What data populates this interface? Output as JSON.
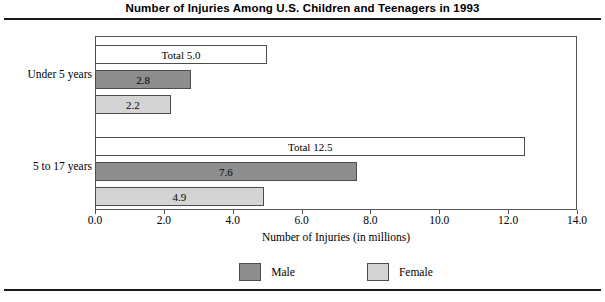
{
  "chart_data": {
    "type": "bar",
    "orientation": "horizontal",
    "title": "Number of Injuries Among U.S. Children and Teenagers in 1993",
    "xlabel": "Number of Injuries (in millions)",
    "ylabel": "",
    "xlim": [
      0.0,
      14.0
    ],
    "xticks": [
      "0.0",
      "2.0",
      "4.0",
      "6.0",
      "8.0",
      "10.0",
      "12.0",
      "14.0"
    ],
    "xtick_values": [
      0.0,
      2.0,
      4.0,
      6.0,
      8.0,
      10.0,
      12.0,
      14.0
    ],
    "grid": false,
    "legend_position": "bottom",
    "categories": [
      "Under 5 years",
      "5 to 17 years"
    ],
    "series": [
      {
        "name": "Total",
        "values": [
          5.0,
          12.5
        ],
        "labels": [
          "Total 5.0",
          "Total 12.5"
        ],
        "color": "#ffffff"
      },
      {
        "name": "Male",
        "values": [
          2.8,
          7.6
        ],
        "labels": [
          "2.8",
          "7.6"
        ],
        "color": "#8e8e8e"
      },
      {
        "name": "Female",
        "values": [
          2.2,
          4.9
        ],
        "labels": [
          "2.2",
          "4.9"
        ],
        "color": "#d4d4d4"
      }
    ],
    "legend": [
      {
        "label": "Male",
        "color": "#8e8e8e"
      },
      {
        "label": "Female",
        "color": "#d4d4d4"
      }
    ]
  },
  "figure": {
    "title": "Number of Injuries Among U.S. Children and Teenagers in 1993",
    "axis_title": "Number of Injuries (in millions)",
    "category_labels": [
      "Under 5 years",
      "5 to 17 years"
    ],
    "tick_labels": [
      "0.0",
      "2.0",
      "4.0",
      "6.0",
      "8.0",
      "10.0",
      "12.0",
      "14.0"
    ],
    "bars": [
      {
        "group": "Under 5 years",
        "series": "Total",
        "label": "Total 5.0"
      },
      {
        "group": "Under 5 years",
        "series": "Male",
        "label": "2.8"
      },
      {
        "group": "Under 5 years",
        "series": "Female",
        "label": "2.2"
      },
      {
        "group": "5 to 17 years",
        "series": "Total",
        "label": "Total 12.5"
      },
      {
        "group": "5 to 17 years",
        "series": "Male",
        "label": "7.6"
      },
      {
        "group": "5 to 17 years",
        "series": "Female",
        "label": "4.9"
      }
    ],
    "legend_labels": [
      "Male",
      "Female"
    ]
  }
}
